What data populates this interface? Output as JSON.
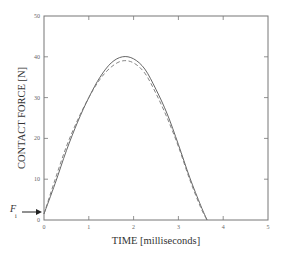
{
  "chart_data": {
    "type": "line",
    "title": "",
    "xlabel": "TIME [milliseconds]",
    "ylabel": "CONTACT FORCE [N]",
    "xlim": [
      0,
      5
    ],
    "ylim": [
      0,
      50
    ],
    "xticks": [
      "0",
      "1",
      "2",
      "3",
      "4",
      "5"
    ],
    "yticks": [
      "0",
      "10",
      "20",
      "30",
      "40",
      "50"
    ],
    "grid": false,
    "legend": null,
    "annotations": [
      {
        "text": "F",
        "subscript": "i",
        "arrow_to": [
          0,
          1.5
        ]
      }
    ],
    "x": [
      0,
      0.25,
      0.5,
      0.75,
      1.0,
      1.25,
      1.5,
      1.75,
      2.0,
      2.25,
      2.5,
      2.75,
      3.0,
      3.25,
      3.5,
      3.64
    ],
    "series": [
      {
        "name": "solid",
        "style": "solid",
        "values": [
          1.5,
          9,
          17,
          24,
          30,
          35,
          38.5,
          40,
          39.5,
          37,
          32,
          26,
          18.5,
          10.5,
          3.5,
          0
        ]
      },
      {
        "name": "dashed",
        "style": "dashed",
        "values": [
          1.5,
          10,
          18,
          24.5,
          30,
          34.5,
          37.5,
          39,
          38.5,
          36,
          31,
          25,
          18,
          10,
          3,
          0
        ]
      }
    ]
  }
}
